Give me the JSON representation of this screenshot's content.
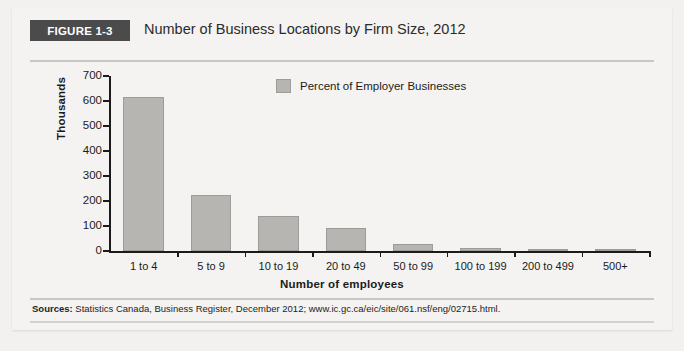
{
  "figure": {
    "badge": "FIGURE 1-3",
    "title": "Number of Business Locations by Firm Size, 2012",
    "source_label": "Sources:",
    "source_text": " Statistics Canada, Business Register, December 2012; www.ic.gc.ca/eic/site/061.nsf/eng/02715.html."
  },
  "colors": {
    "bar_fill": "#b6b5b2",
    "bar_stroke": "#9d9c99",
    "badge_bg": "#4b4b4b",
    "panel_bg": "#f4f3f1",
    "axis": "#1b1b1b"
  },
  "chart_data": {
    "type": "bar",
    "title": "Number of Business Locations by Firm Size, 2012",
    "xlabel": "Number of employees",
    "ylabel": "Thousands",
    "ylim": [
      0,
      700
    ],
    "yticks": [
      0,
      100,
      200,
      300,
      400,
      500,
      600,
      700
    ],
    "ytick_labels": [
      "0",
      "100",
      "200",
      "300",
      "400",
      "500",
      "600",
      "700"
    ],
    "grid": false,
    "legend": [
      "Percent of Employer Businesses"
    ],
    "legend_position": "top-center",
    "categories": [
      "1 to 4",
      "5 to 9",
      "10 to 19",
      "20 to 49",
      "50 to 99",
      "100 to 199",
      "200 to 499",
      "500+"
    ],
    "series": [
      {
        "name": "Percent of Employer Businesses",
        "values": [
          618,
          225,
          140,
          92,
          30,
          12,
          4,
          1
        ]
      }
    ]
  }
}
